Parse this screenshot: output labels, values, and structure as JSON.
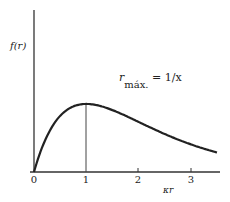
{
  "chart_data": {
    "type": "line",
    "title": "",
    "xlabel": "κr",
    "ylabel": "f(r)",
    "x_ticks": [
      "0",
      "1",
      "2",
      "3"
    ],
    "xlim": [
      0,
      3.5
    ],
    "grid": false,
    "series": [
      {
        "name": "f(r) = κr·e^(-κr)",
        "x": [
          0,
          0.25,
          0.5,
          0.75,
          1.0,
          1.5,
          2.0,
          2.5,
          3.0,
          3.5
        ],
        "y": [
          0,
          0.195,
          0.303,
          0.354,
          0.368,
          0.335,
          0.271,
          0.205,
          0.149,
          0.106
        ]
      }
    ],
    "annotations": [
      {
        "text": "r_máx. = 1/κ",
        "x": 1.0,
        "marker": "vertical line at peak"
      }
    ]
  },
  "labels": {
    "ylabel": "f(r)",
    "xlabel": "κr",
    "annotation_r": "r",
    "annotation_sub": "máx.",
    "annotation_eq": "= 1/x",
    "ticks": [
      "0",
      "1",
      "2",
      "3"
    ]
  }
}
